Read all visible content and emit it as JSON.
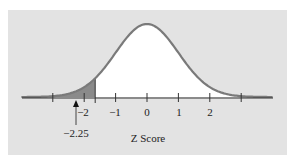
{
  "chart_data": {
    "type": "area",
    "title": "",
    "xlabel": "Z Score",
    "ylabel": "",
    "distribution": "standard normal",
    "x_ticks": [
      -3,
      -2,
      -1,
      0,
      1,
      2,
      3
    ],
    "x_tick_labels": [
      "",
      "−2",
      "−1",
      "0",
      "1",
      "2",
      ""
    ],
    "shaded_region": {
      "from": -4,
      "to": -1.65,
      "color": "#8a8a8a"
    },
    "annotation": {
      "label": "−2.25",
      "x": -2.25,
      "marker": "arrow-up"
    },
    "xlim": [
      -4,
      4
    ],
    "curve_color": "#7a7a7a",
    "background": "#e3e3e3",
    "fill_under_curve": "#ffffff"
  },
  "labels": {
    "xlabel": "Z Score",
    "annotation": "−2.25",
    "ticks": [
      "−2",
      "−1",
      "0",
      "1",
      "2"
    ]
  }
}
